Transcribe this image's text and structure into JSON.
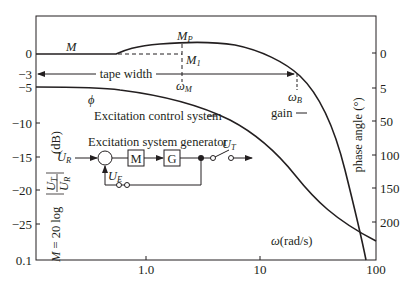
{
  "figure": {
    "type": "bode-diagram",
    "left_axis": {
      "label_formula": "M = 20 log |U_T / U_R|",
      "unit": "(dB)",
      "ticks": [
        "0",
        "−3",
        "−5",
        "−10",
        "−15",
        "−20",
        "−25",
        "0.1"
      ]
    },
    "right_axis": {
      "label": "phase angle (°)",
      "ticks": [
        "0",
        "5",
        "50",
        "100",
        "150",
        "200"
      ]
    },
    "x_axis": {
      "label": "ω(rad/s)",
      "ticks": [
        "1.0",
        "10",
        "100"
      ]
    },
    "curves": {
      "magnitude": "M",
      "phase": "ϕ"
    },
    "annotations": {
      "peak": "M",
      "peak_sub": "P",
      "m1": "M",
      "m1_sub": "1",
      "omega_m": "ω",
      "omega_m_sub": "M",
      "omega_b": "ω",
      "omega_b_sub": "B",
      "tape_width": "tape width",
      "gain": "gain",
      "control_system": "Excitation control system"
    },
    "block_diagram": {
      "title": "Excitation system generator",
      "input": "U",
      "input_sub": "R",
      "output": "U",
      "output_sub": "T",
      "feedback": "U",
      "feedback_sub": "E",
      "block1": "M",
      "block2": "G"
    }
  }
}
